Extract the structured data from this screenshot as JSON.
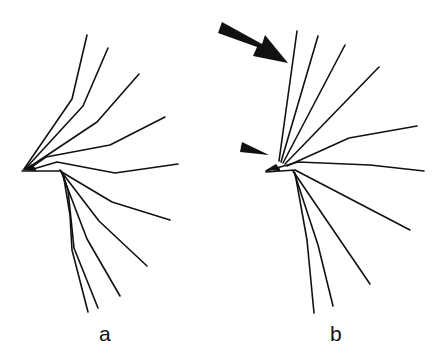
{
  "figure": {
    "line_color": "#111111",
    "panels": [
      {
        "label": "a",
        "label_pos": [
          99,
          337
        ],
        "origin": [
          22,
          170
        ],
        "branches": [
          {
            "points": [
              [
                24,
                169
              ],
              [
                72,
                99
              ],
              [
                87,
                35
              ]
            ]
          },
          {
            "points": [
              [
                26,
                168
              ],
              [
                83,
                106
              ],
              [
                108,
                48
              ]
            ]
          },
          {
            "points": [
              [
                28,
                168
              ],
              [
                97,
                122
              ],
              [
                139,
                74
              ]
            ]
          },
          {
            "points": [
              [
                30,
                168
              ],
              [
                46,
                157
              ],
              [
                110,
                145
              ],
              [
                165,
                117
              ]
            ]
          },
          {
            "points": [
              [
                30,
                170
              ],
              [
                57,
                162
              ],
              [
                115,
                173
              ],
              [
                178,
                164
              ]
            ]
          },
          {
            "points": [
              [
                22,
                171
              ],
              [
                60,
                171
              ],
              [
                112,
                202
              ],
              [
                170,
                220
              ]
            ]
          },
          {
            "points": [
              [
                60,
                170
              ],
              [
                99,
                221
              ],
              [
                147,
                266
              ]
            ]
          },
          {
            "points": [
              [
                61,
                171
              ],
              [
                87,
                239
              ],
              [
                120,
                296
              ]
            ]
          },
          {
            "points": [
              [
                62,
                172
              ],
              [
                68,
                190
              ],
              [
                74,
                248
              ],
              [
                98,
                308
              ]
            ]
          },
          {
            "points": [
              [
                63,
                173
              ],
              [
                70,
                215
              ],
              [
                72,
                250
              ],
              [
                88,
                312
              ]
            ]
          }
        ]
      },
      {
        "label": "b",
        "label_pos": [
          331,
          337
        ],
        "origin": [
          266,
          170
        ],
        "branches": [
          {
            "points": [
              [
                279,
                161
              ],
              [
                297,
                31
              ]
            ]
          },
          {
            "points": [
              [
                281,
                162
              ],
              [
                318,
                36
              ]
            ]
          },
          {
            "points": [
              [
                283,
                163
              ],
              [
                345,
                45
              ]
            ]
          },
          {
            "points": [
              [
                285,
                164
              ],
              [
                379,
                67
              ]
            ]
          },
          {
            "points": [
              [
                287,
                166
              ],
              [
                349,
                138
              ],
              [
                417,
                126
              ]
            ]
          },
          {
            "points": [
              [
                266,
                171
              ],
              [
                298,
                162
              ],
              [
                370,
                165
              ],
              [
                424,
                171
              ]
            ]
          },
          {
            "points": [
              [
                266,
                172
              ],
              [
                295,
                170
              ],
              [
                410,
                230
              ]
            ]
          },
          {
            "points": [
              [
                293,
                171
              ],
              [
                370,
                284
              ]
            ]
          },
          {
            "points": [
              [
                294,
                172
              ],
              [
                318,
                245
              ],
              [
                333,
                306
              ]
            ]
          },
          {
            "points": [
              [
                295,
                173
              ],
              [
                307,
                240
              ],
              [
                314,
                313
              ]
            ]
          }
        ],
        "annotations": [
          {
            "type": "arrow",
            "name": "large-arrow",
            "tip": [
              288,
              63
            ],
            "tail": [
              222,
              27
            ]
          },
          {
            "type": "arrowhead",
            "name": "small-arrowhead",
            "tip": [
              269,
              155
            ]
          }
        ]
      }
    ]
  }
}
